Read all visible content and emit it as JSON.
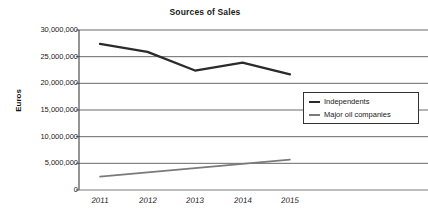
{
  "chart_data": {
    "type": "line",
    "title": "Sources of Sales",
    "xlabel": "",
    "ylabel": "Euros",
    "categories": [
      "2011",
      "2012",
      "2013",
      "2014",
      "2015"
    ],
    "series": [
      {
        "name": "Independents",
        "color": "#2b2b2b",
        "values": [
          27400000,
          25900000,
          22400000,
          23900000,
          21700000
        ]
      },
      {
        "name": "Major oil companies",
        "color": "#7a7a7a",
        "values": [
          2500000,
          3300000,
          4100000,
          4900000,
          5700000
        ]
      }
    ],
    "ylim": [
      0,
      30000000
    ],
    "ytick_values": [
      0,
      5000000,
      10000000,
      15000000,
      20000000,
      25000000,
      30000000
    ],
    "ytick_labels": [
      "0",
      "5,000,000",
      "10,000,000",
      "15,000,000",
      "20,000,000",
      "25,000,000",
      "30,000,000"
    ],
    "grid": true,
    "legend_position": "center-right",
    "legend_entries": [
      "Independents",
      "Major oil companies"
    ]
  },
  "colors": {
    "background": "#ffffff",
    "axis": "#4d4d4d",
    "gridline": "#595959",
    "text": "#1a1a1a",
    "series_independents": "#2b2b2b",
    "series_major_oil": "#7a7a7a",
    "legend_border": "#333333"
  }
}
